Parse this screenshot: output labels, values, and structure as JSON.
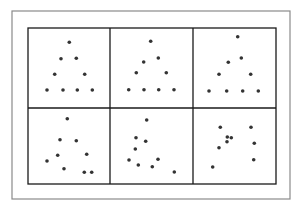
{
  "figure": {
    "width": 303,
    "height": 211,
    "outer_frame": {
      "x": 12,
      "y": 11,
      "w": 278,
      "h": 188,
      "stroke": "#8a8a8a",
      "stroke_width": 1.2
    },
    "grid": {
      "x": 28,
      "y": 28,
      "w": 248,
      "h": 156,
      "col_dividers": [
        110,
        193
      ],
      "row_dividers": [
        108
      ],
      "stroke": "#1a1a1a",
      "stroke_width": 1.3
    },
    "dot_color": "#333333",
    "dot_radius": 1.8
  },
  "panels": [
    {
      "id": "panel-1",
      "dots": [
        [
          69.3,
          42.3
        ],
        [
          61,
          58.7
        ],
        [
          76.3,
          58.3
        ],
        [
          54.7,
          74.3
        ],
        [
          84.7,
          74.3
        ],
        [
          47,
          90
        ],
        [
          63,
          90
        ],
        [
          77.3,
          90
        ],
        [
          92.3,
          90
        ]
      ]
    },
    {
      "id": "panel-2",
      "dots": [
        [
          150.7,
          41.3
        ],
        [
          143.7,
          62
        ],
        [
          158.3,
          58
        ],
        [
          136.3,
          72.7
        ],
        [
          166.3,
          72.7
        ],
        [
          128.7,
          89.7
        ],
        [
          144,
          89.7
        ],
        [
          158.7,
          89.7
        ],
        [
          174,
          89.7
        ]
      ]
    },
    {
      "id": "panel-3",
      "dots": [
        [
          237.7,
          36.7
        ],
        [
          228.3,
          62.3
        ],
        [
          241.3,
          58
        ],
        [
          219,
          74.3
        ],
        [
          250.7,
          74.3
        ],
        [
          209,
          91
        ],
        [
          226.7,
          91
        ],
        [
          242.7,
          91
        ],
        [
          258.3,
          91
        ]
      ]
    },
    {
      "id": "panel-4",
      "dots": [
        [
          67.3,
          118.7
        ],
        [
          60,
          139.7
        ],
        [
          76.3,
          140.7
        ],
        [
          57.7,
          155.3
        ],
        [
          86.7,
          154.3
        ],
        [
          47,
          161
        ],
        [
          64,
          168.7
        ],
        [
          84.3,
          172.3
        ],
        [
          91.7,
          172.3
        ]
      ]
    },
    {
      "id": "panel-5",
      "dots": [
        [
          146.7,
          120
        ],
        [
          136,
          137.7
        ],
        [
          145.7,
          141.3
        ],
        [
          135.3,
          149
        ],
        [
          129,
          160
        ],
        [
          158,
          159.3
        ],
        [
          138.3,
          165
        ],
        [
          152.3,
          166.7
        ],
        [
          174.3,
          172
        ]
      ]
    },
    {
      "id": "panel-6",
      "dots": [
        [
          220.3,
          127.3
        ],
        [
          251,
          127.3
        ],
        [
          227.3,
          137
        ],
        [
          231.3,
          137.7
        ],
        [
          227,
          141.7
        ],
        [
          254.3,
          143.3
        ],
        [
          219,
          147.7
        ],
        [
          253.7,
          159.7
        ],
        [
          212.7,
          167
        ]
      ]
    }
  ]
}
